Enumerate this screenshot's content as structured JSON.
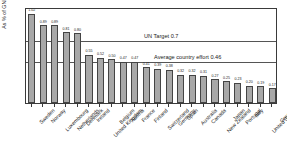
{
  "chart_data": {
    "type": "bar",
    "title": "",
    "xlabel": "",
    "ylabel": "As % of GNI",
    "ylim": [
      0.0,
      1.1
    ],
    "ytick_labels": [
      "0.0",
      "0.1",
      "0.2",
      "0.3",
      "0.4",
      "0.5",
      "0.6",
      "0.7",
      "0.8",
      "0.9",
      "1.0",
      "1.1"
    ],
    "ytick_values": [
      0.0,
      0.1,
      0.2,
      0.3,
      0.4,
      0.5,
      0.6,
      0.7,
      0.8,
      0.9,
      1.0,
      1.1
    ],
    "grid": false,
    "legend": "none",
    "bar_color": "#a8a8a8",
    "bar_edge_color": "#444444",
    "categories": [
      "Sweden",
      "Norway",
      "Luxembourg",
      "Netherlands",
      "Denmark",
      "Ireland",
      "United Kingdom",
      "Belgium",
      "Austria",
      "France",
      "Finland",
      "Switzerland",
      "Germany",
      "Spain",
      "Australia",
      "Canada",
      "New Zealand",
      "Japan",
      "Portugal",
      "Italy",
      "United States",
      "Greece"
    ],
    "values": [
      1.02,
      0.89,
      0.89,
      0.81,
      0.8,
      0.55,
      0.52,
      0.5,
      0.47,
      0.47,
      0.41,
      0.39,
      0.38,
      0.32,
      0.32,
      0.31,
      0.27,
      0.25,
      0.23,
      0.2,
      0.19,
      0.17
    ],
    "value_labels": [
      "1.02",
      "0.89",
      "0.89",
      "0.81",
      "0.80",
      "0.55",
      "0.52",
      "0.50",
      "0.47",
      "0.47",
      "0.41",
      "0.39",
      "0.38",
      "0.32",
      "0.32",
      "0.31",
      "0.27",
      "0.25",
      "0.23",
      "0.20",
      "0.19",
      "0.17"
    ],
    "annotations": [
      {
        "label": "UN Target 0.7",
        "value": 0.7,
        "line_color": "#555555"
      },
      {
        "label": "Average country effort 0.46",
        "value": 0.46,
        "line_color": "#555555"
      }
    ]
  }
}
